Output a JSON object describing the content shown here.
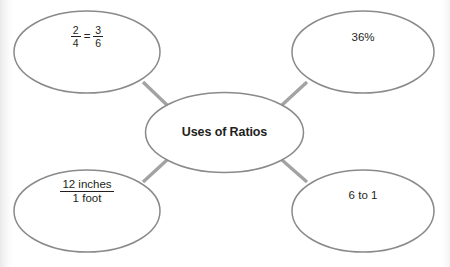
{
  "diagram": {
    "type": "concept-map",
    "center": {
      "id": "center",
      "label": "Uses of Ratios",
      "shape": "ellipse",
      "cx": 224.5,
      "cy": 132.5,
      "rx": 79,
      "ry": 40
    },
    "colors": {
      "background": "#ffffff",
      "node_stroke": "#8a8a8c",
      "connector_stroke": "#a3a3a5",
      "text": "#231f20"
    },
    "nodes": [
      {
        "id": "node-fraction-equivalence",
        "name": "fraction-equivalence",
        "kind": "fraction-equation",
        "label": "2/4 = 3/6",
        "numerator_left": "2",
        "denominator_left": "4",
        "equals": "=",
        "numerator_right": "3",
        "denominator_right": "6",
        "shape": "ellipse",
        "cx": 87,
        "cy": 52,
        "rx": 73,
        "ry": 41,
        "position": "top-left"
      },
      {
        "id": "node-percent",
        "name": "percent",
        "kind": "text",
        "label": "36%",
        "shape": "ellipse",
        "cx": 363,
        "cy": 52,
        "rx": 71,
        "ry": 41,
        "position": "top-right"
      },
      {
        "id": "node-unit-rate",
        "name": "unit-rate",
        "kind": "fraction",
        "label": "12 inches / 1 foot",
        "numerator": "12 inches",
        "denominator": "1 foot",
        "shape": "ellipse",
        "cx": 87,
        "cy": 211,
        "rx": 73,
        "ry": 41,
        "position": "bottom-left"
      },
      {
        "id": "node-ratio-words",
        "name": "ratio-words",
        "kind": "text",
        "label": "6 to 1",
        "shape": "ellipse",
        "cx": 363,
        "cy": 211,
        "rx": 71,
        "ry": 41,
        "position": "bottom-right"
      }
    ],
    "connectors": [
      {
        "id": "connector-top-left",
        "from": "center",
        "to": "node-fraction-equivalence",
        "x1": 167,
        "y1": 105,
        "x2": 143,
        "y2": 82
      },
      {
        "id": "connector-top-right",
        "from": "center",
        "to": "node-percent",
        "x1": 282,
        "y1": 105,
        "x2": 307,
        "y2": 82
      },
      {
        "id": "connector-bottom-left",
        "from": "center",
        "to": "node-unit-rate",
        "x1": 167,
        "y1": 160,
        "x2": 143,
        "y2": 182
      },
      {
        "id": "connector-bottom-right",
        "from": "center",
        "to": "node-ratio-words",
        "x1": 282,
        "y1": 160,
        "x2": 307,
        "y2": 182
      }
    ]
  }
}
